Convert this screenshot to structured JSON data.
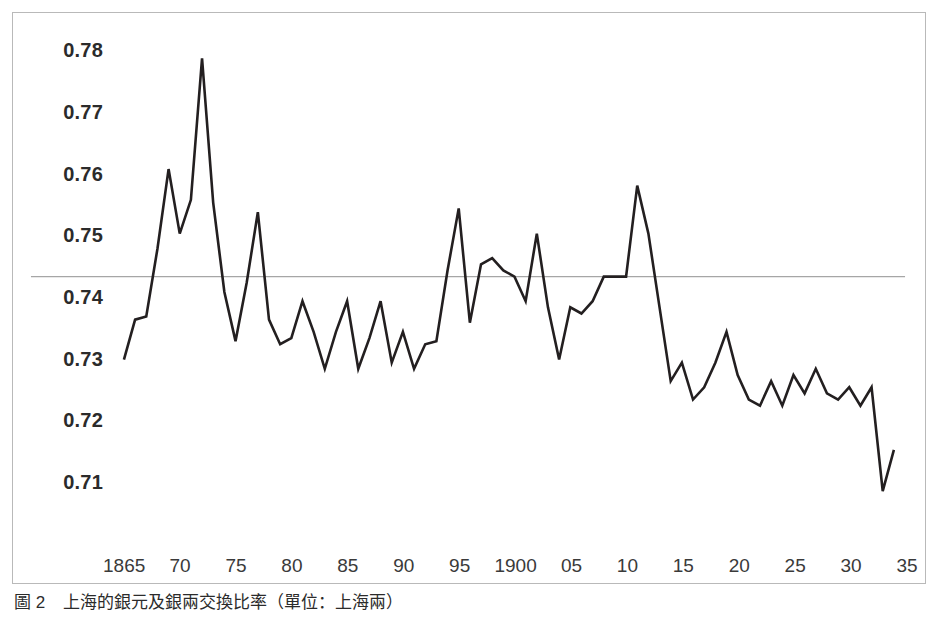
{
  "figure": {
    "caption_label": "圖 2",
    "caption_text": "上海的銀元及銀兩交換比率（單位：上海兩）",
    "border_color": "#b9b9b9",
    "line_color": "#231f20",
    "reference_line_color": "#a6a6a6"
  },
  "chart_data": {
    "type": "line",
    "title": "",
    "xlabel": "",
    "ylabel": "",
    "xlim": [
      1864,
      1935
    ],
    "ylim": [
      0.705,
      0.7825
    ],
    "grid": false,
    "legend": "none",
    "y_ticks": [
      "0.78",
      "0.77",
      "0.76",
      "0.75",
      "0.74",
      "0.73",
      "0.72",
      "0.71"
    ],
    "y_tick_values": [
      0.78,
      0.77,
      0.76,
      0.75,
      0.74,
      0.73,
      0.72,
      0.71
    ],
    "x_ticks": [
      "1865",
      "70",
      "75",
      "80",
      "85",
      "90",
      "95",
      "1900",
      "05",
      "10",
      "15",
      "20",
      "25",
      "30",
      "35"
    ],
    "x_tick_values": [
      1865,
      1870,
      1875,
      1880,
      1885,
      1890,
      1895,
      1900,
      1905,
      1910,
      1915,
      1920,
      1925,
      1930,
      1935
    ],
    "reference_line": 0.7435,
    "annotations": [],
    "series": [
      {
        "name": "上海銀元及銀兩交換比率",
        "x": [
          1865,
          1866,
          1867,
          1868,
          1869,
          1870,
          1871,
          1872,
          1873,
          1874,
          1875,
          1876,
          1877,
          1878,
          1879,
          1880,
          1881,
          1882,
          1883,
          1884,
          1885,
          1886,
          1887,
          1888,
          1889,
          1890,
          1891,
          1892,
          1893,
          1894,
          1895,
          1896,
          1897,
          1898,
          1899,
          1900,
          1901,
          1902,
          1903,
          1904,
          1905,
          1906,
          1907,
          1908,
          1909,
          1910,
          1911,
          1912,
          1913,
          1914,
          1915,
          1916,
          1917,
          1918,
          1919,
          1920,
          1921,
          1922,
          1923,
          1924,
          1925,
          1926,
          1927,
          1928,
          1929,
          1930,
          1931,
          1932,
          1933,
          1934
        ],
        "values": [
          0.73,
          0.7365,
          0.737,
          0.748,
          0.761,
          0.7505,
          0.756,
          0.779,
          0.7555,
          0.741,
          0.733,
          0.7425,
          0.754,
          0.7365,
          0.7325,
          0.7335,
          0.7395,
          0.7345,
          0.7285,
          0.7345,
          0.7395,
          0.7285,
          0.7335,
          0.7395,
          0.7295,
          0.7345,
          0.7285,
          0.7325,
          0.733,
          0.7445,
          0.7546,
          0.736,
          0.7455,
          0.7465,
          0.7445,
          0.7435,
          0.7395,
          0.7505,
          0.7385,
          0.73,
          0.7385,
          0.7375,
          0.7395,
          0.7435,
          0.7435,
          0.7435,
          0.7583,
          0.7505,
          0.7385,
          0.7265,
          0.7295,
          0.7235,
          0.7255,
          0.7295,
          0.7345,
          0.7275,
          0.7235,
          0.7225,
          0.7265,
          0.7225,
          0.7275,
          0.7245,
          0.7285,
          0.7245,
          0.7235,
          0.7255,
          0.7225,
          0.7255,
          0.7086,
          0.7153
        ]
      }
    ]
  }
}
